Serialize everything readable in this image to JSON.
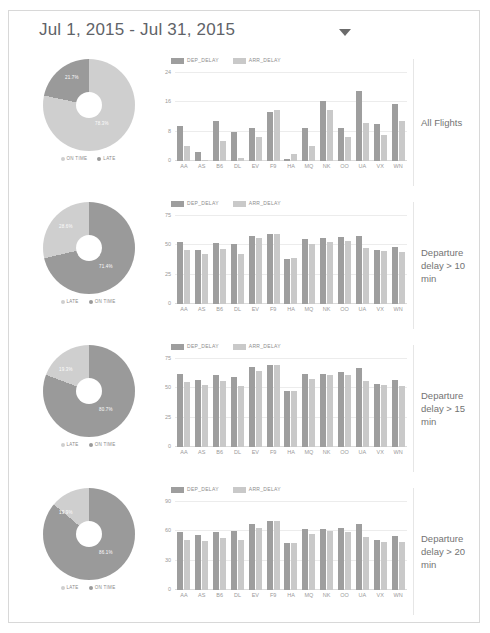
{
  "header": {
    "date_range": "Jul 1, 2015 - Jul 31, 2015",
    "caret_icon": "chevron-down-icon"
  },
  "colors": {
    "dep_delay": "#9e9e9e",
    "arr_delay": "#c9c9c9",
    "on_time": "#cfcfcf",
    "late": "#9a9a9a",
    "grid": "#ececec",
    "text": "#9a9a9a"
  },
  "bar_legend": [
    {
      "label": "DEP_DELAY",
      "color": "#9e9e9e"
    },
    {
      "label": "ARR_DELAY",
      "color": "#c9c9c9"
    }
  ],
  "rows": [
    {
      "side_label": "All Flights",
      "pie_legend": [
        {
          "label": "ON TIME",
          "color": "#cfcfcf"
        },
        {
          "label": "LATE",
          "color": "#9a9a9a"
        }
      ],
      "donut": {
        "on_time_pct": "78.3%",
        "late_pct": "21.7%",
        "on_time_value": 78.3,
        "late_value": 21.7
      },
      "chart_data": {
        "type": "bar",
        "title": "",
        "xlabel": "",
        "ylabel": "",
        "categories": [
          "AA",
          "AS",
          "B6",
          "DL",
          "EV",
          "F9",
          "HA",
          "MQ",
          "NK",
          "OO",
          "UA",
          "VX",
          "WN"
        ],
        "yticks": [
          0,
          8,
          16,
          24
        ],
        "ylim": [
          0,
          24
        ],
        "grid": true,
        "legend_position": "top-left",
        "series": [
          {
            "name": "DEP_DELAY",
            "values": [
              9.5,
              2.5,
              11,
              8,
              9,
              13.5,
              0.5,
              9,
              16.5,
              9,
              19,
              10,
              15.5
            ]
          },
          {
            "name": "ARR_DELAY",
            "values": [
              4,
              0.3,
              5.5,
              0.7,
              6.5,
              14,
              2,
              4,
              14,
              6.5,
              10.5,
              7,
              11
            ]
          }
        ]
      }
    },
    {
      "side_label": "Departure delay > 10 min",
      "pie_legend": [
        {
          "label": "LATE",
          "color": "#cfcfcf"
        },
        {
          "label": "ON TIME",
          "color": "#9a9a9a"
        }
      ],
      "donut": {
        "on_time_pct": "71.4%",
        "late_pct": "28.6%",
        "on_time_value": 71.4,
        "late_value": 28.6
      },
      "chart_data": {
        "type": "bar",
        "title": "",
        "xlabel": "",
        "ylabel": "",
        "categories": [
          "AA",
          "AS",
          "B6",
          "DL",
          "EV",
          "F9",
          "HA",
          "MQ",
          "NK",
          "OO",
          "UA",
          "VX",
          "WN"
        ],
        "yticks": [
          0,
          25,
          50,
          75
        ],
        "ylim": [
          0,
          75
        ],
        "grid": true,
        "legend_position": "top-left",
        "series": [
          {
            "name": "DEP_DELAY",
            "values": [
              53,
              46,
              52,
              51,
              58,
              60,
              38,
              55,
              56,
              57,
              58,
              46,
              49
            ]
          },
          {
            "name": "ARR_DELAY",
            "values": [
              46,
              43,
              47,
              43,
              56,
              60,
              39,
              51,
              53,
              54,
              48,
              45,
              44
            ]
          }
        ]
      }
    },
    {
      "side_label": "Departure delay > 15 min",
      "pie_legend": [
        {
          "label": "LATE",
          "color": "#cfcfcf"
        },
        {
          "label": "ON TIME",
          "color": "#9a9a9a"
        }
      ],
      "donut": {
        "on_time_pct": "80.7%",
        "late_pct": "19.3%",
        "on_time_value": 80.7,
        "late_value": 19.3
      },
      "chart_data": {
        "type": "bar",
        "title": "",
        "xlabel": "",
        "ylabel": "",
        "categories": [
          "AA",
          "AS",
          "B6",
          "DL",
          "EV",
          "F9",
          "HA",
          "MQ",
          "NK",
          "OO",
          "UA",
          "VX",
          "WN"
        ],
        "yticks": [
          0,
          25,
          50,
          75
        ],
        "ylim": [
          0,
          75
        ],
        "grid": true,
        "legend_position": "top-left",
        "series": [
          {
            "name": "DEP_DELAY",
            "values": [
              62,
              57,
              61,
              60,
              68,
              70,
              48,
              62,
              62,
              64,
              67,
              54,
              57
            ]
          },
          {
            "name": "ARR_DELAY",
            "values": [
              55,
              53,
              56,
              52,
              65,
              70,
              48,
              58,
              61,
              61,
              56,
              53,
              52
            ]
          }
        ]
      }
    },
    {
      "side_label": "Departure delay > 20 min",
      "pie_legend": [
        {
          "label": "LATE",
          "color": "#cfcfcf"
        },
        {
          "label": "ON TIME",
          "color": "#9a9a9a"
        }
      ],
      "donut": {
        "on_time_pct": "86.1%",
        "late_pct": "13.9%",
        "on_time_value": 86.1,
        "late_value": 13.9
      },
      "chart_data": {
        "type": "bar",
        "title": "",
        "xlabel": "",
        "ylabel": "",
        "categories": [
          "AA",
          "AS",
          "B6",
          "DL",
          "EV",
          "F9",
          "HA",
          "MQ",
          "NK",
          "OO",
          "UA",
          "VX",
          "WN"
        ],
        "yticks": [
          0,
          30,
          60,
          90
        ],
        "ylim": [
          0,
          90
        ],
        "grid": true,
        "legend_position": "top-left",
        "series": [
          {
            "name": "DEP_DELAY",
            "values": [
              59,
              56,
              59,
              60,
              68,
              71,
              48,
              62,
              62,
              63,
              68,
              51,
              55
            ]
          },
          {
            "name": "ARR_DELAY",
            "values": [
              51,
              50,
              53,
              51,
              63,
              71,
              48,
              57,
              60,
              59,
              54,
              49,
              49
            ]
          }
        ]
      }
    }
  ]
}
